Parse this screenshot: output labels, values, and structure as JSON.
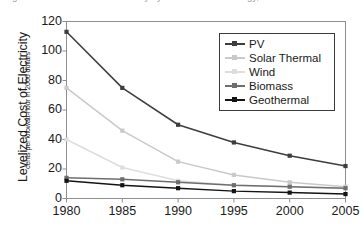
{
  "figure": {
    "clipped_caption": "Figure: Levelized cost of electricity by renewable technology, 1980-2005"
  },
  "axes": {
    "ylabel_main": "Levelized Cost of Electricity",
    "ylabel_sub": "cents per kilowatt-hour in 2006 dollars",
    "xlabel": "",
    "ytick_labels": [
      "120",
      "100",
      "80",
      "60",
      "40",
      "20",
      "0"
    ],
    "xtick_labels": [
      "1980",
      "1985",
      "1990",
      "1995",
      "2000",
      "2005"
    ]
  },
  "legend": {
    "position": "upper-right-inside",
    "entries": [
      {
        "label": "PV",
        "color": "#3d3d3d"
      },
      {
        "label": "Solar Thermal",
        "color": "#c9c9c9"
      },
      {
        "label": "Wind",
        "color": "#dedede"
      },
      {
        "label": "Biomass",
        "color": "#6e6e6e"
      },
      {
        "label": "Geothermal",
        "color": "#141414"
      }
    ]
  },
  "chart_data": {
    "type": "line",
    "title": "",
    "xlabel": "",
    "ylabel": "Levelized Cost of Electricity (cents per kilowatt-hour in 2006 dollars)",
    "x": [
      1980,
      1985,
      1990,
      1995,
      2000,
      2005
    ],
    "xlim": [
      1980,
      2005
    ],
    "ylim": [
      0,
      120
    ],
    "yticks": [
      0,
      20,
      40,
      60,
      80,
      100,
      120
    ],
    "xticks": [
      1980,
      1985,
      1990,
      1995,
      2000,
      2005
    ],
    "grid": false,
    "legend_position": "upper right",
    "series": [
      {
        "name": "PV",
        "color": "#3d3d3d",
        "values": [
          113,
          75,
          50,
          38,
          29,
          22
        ]
      },
      {
        "name": "Solar Thermal",
        "color": "#c9c9c9",
        "values": [
          75,
          46,
          25,
          16,
          11,
          8
        ]
      },
      {
        "name": "Wind",
        "color": "#dedede",
        "values": [
          40,
          21,
          12,
          9,
          8,
          7
        ]
      },
      {
        "name": "Biomass",
        "color": "#6e6e6e",
        "values": [
          14,
          13,
          11,
          9,
          8,
          7
        ]
      },
      {
        "name": "Geothermal",
        "color": "#141414",
        "values": [
          12,
          9,
          7,
          5,
          4,
          3
        ]
      }
    ]
  }
}
